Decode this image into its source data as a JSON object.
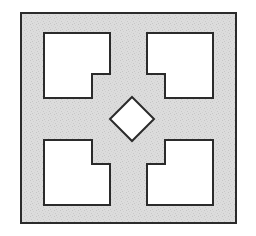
{
  "figure": {
    "canvas": {
      "width": 256,
      "height": 236,
      "background": "#ffffff"
    },
    "colors": {
      "background": "#ffffff",
      "plate_fill": "#d9d9d9",
      "plate_speckle": "#c9c9c9",
      "hole_fill": "#ffffff",
      "stroke": "#2b2b2b"
    },
    "stroke_width": 2,
    "outer_plate": {
      "name": "outer-square",
      "x": 21,
      "y": 13,
      "width": 215,
      "height": 210,
      "fill": "#d9d9d9",
      "stroke": "#2b2b2b"
    },
    "holes": [
      {
        "name": "notched-square-top-left",
        "label": "Top-left notched square",
        "orientation": "notch-bottom-right",
        "points": "44,33 110,33 110,74 92,74 92,98 44,98",
        "fill": "#ffffff",
        "stroke": "#2b2b2b"
      },
      {
        "name": "notched-square-top-right",
        "label": "Top-right notched square",
        "orientation": "notch-bottom-left",
        "points": "147,33 213,33 213,98 165,98 165,74 147,74",
        "fill": "#ffffff",
        "stroke": "#2b2b2b"
      },
      {
        "name": "notched-square-bottom-left",
        "label": "Bottom-left notched square",
        "orientation": "notch-top-right",
        "points": "44,140 92,140 92,164 110,164 110,205 44,205",
        "fill": "#ffffff",
        "stroke": "#2b2b2b"
      },
      {
        "name": "notched-square-bottom-right",
        "label": "Bottom-right notched square",
        "orientation": "notch-top-left",
        "points": "165,140 213,140 213,205 147,205 147,164 165,164",
        "fill": "#ffffff",
        "stroke": "#2b2b2b"
      },
      {
        "name": "center-diamond",
        "label": "Center diamond",
        "orientation": "rhombus",
        "points": "132,97 154,119 132,141 110,119",
        "fill": "#ffffff",
        "stroke": "#2b2b2b"
      }
    ]
  }
}
